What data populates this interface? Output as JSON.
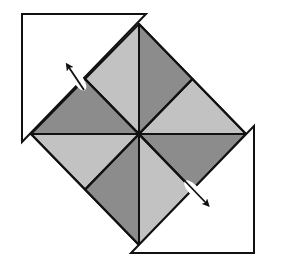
{
  "diagram": {
    "type": "origami-fold-instruction",
    "colors": {
      "light": "#c2c2c2",
      "dark": "#8c8c8c",
      "flap": "#ffffff",
      "stroke": "#111111"
    },
    "diamond": {
      "center": [
        139,
        134
      ],
      "top": [
        139,
        24
      ],
      "right": [
        246,
        134
      ],
      "bottom": [
        139,
        245
      ],
      "left": [
        31,
        134
      ]
    },
    "segments": [
      {
        "name": "segment-top-left",
        "shade": "light"
      },
      {
        "name": "segment-top-right",
        "shade": "dark"
      },
      {
        "name": "segment-right-top",
        "shade": "light"
      },
      {
        "name": "segment-right-bottom",
        "shade": "dark"
      },
      {
        "name": "segment-bottom-right",
        "shade": "light"
      },
      {
        "name": "segment-bottom-left",
        "shade": "dark"
      },
      {
        "name": "segment-left-bottom",
        "shade": "light"
      },
      {
        "name": "segment-left-top",
        "shade": "dark"
      }
    ],
    "flaps": [
      {
        "name": "top-left-flap",
        "points": [
          [
            22,
            14
          ],
          [
            146,
            14
          ],
          [
            22,
            142
          ]
        ]
      },
      {
        "name": "bottom-right-flap",
        "points": [
          [
            254,
            126
          ],
          [
            254,
            253
          ],
          [
            131,
            253
          ]
        ]
      }
    ],
    "arrows": [
      {
        "name": "fold-arrow-top-left",
        "direction": "up-left",
        "from": [
          84,
          90
        ],
        "to": [
          68,
          66
        ]
      },
      {
        "name": "fold-arrow-bottom-right",
        "direction": "down-right",
        "from": [
          184,
          180
        ],
        "to": [
          207,
          204
        ]
      }
    ]
  }
}
